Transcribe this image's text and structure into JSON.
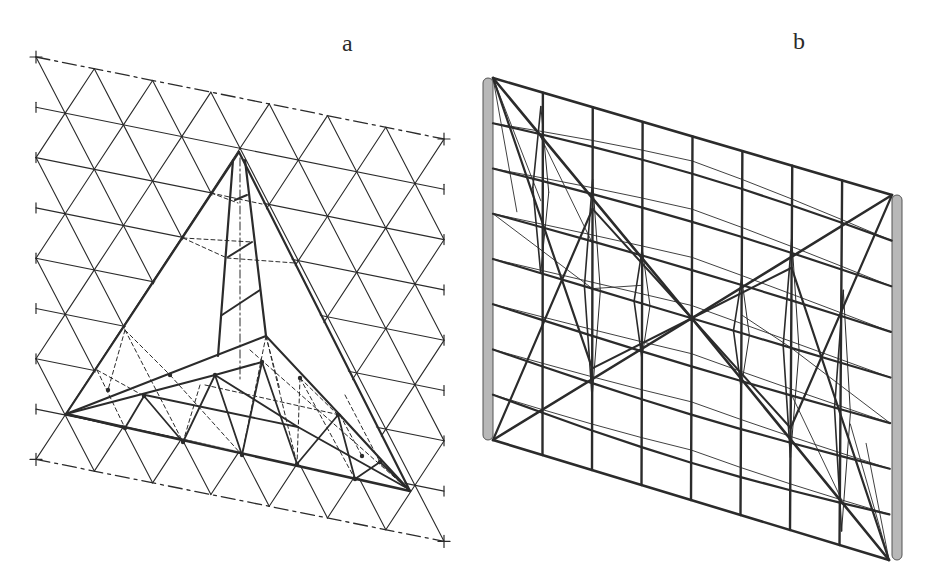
{
  "figure": {
    "panels": [
      {
        "id": "a",
        "label": "a",
        "description": "Triangular grid shell with inverted three-legged pyramidal truss (plan/axonometric view)"
      },
      {
        "id": "b",
        "label": "b",
        "description": "Rectangular grid wall between two posts with X-shaped tensegrity-like diagonal bracing"
      }
    ]
  },
  "colors": {
    "ink": "#2b2b2b",
    "thin_ink": "#3a3a3a",
    "post_fill": "#b8b8b8",
    "background": "#ffffff"
  },
  "panel_a": {
    "origin": [
      36,
      57
    ],
    "row_spacing": 50.3,
    "rows": 9,
    "col_width": 58.3,
    "cols": 7,
    "shear": 0.2,
    "truss": {
      "apex": [
        239,
        152
      ],
      "left": [
        66,
        414
      ],
      "right": [
        410,
        491
      ],
      "hub": [
        266,
        336
      ]
    }
  },
  "panel_b": {
    "left_post": {
      "x": 488,
      "top": 78,
      "bottom": 440
    },
    "right_post": {
      "x": 897,
      "top": 195,
      "bottom": 560
    },
    "columns": 8,
    "rows": 8,
    "center": [
      688,
      320
    ]
  }
}
